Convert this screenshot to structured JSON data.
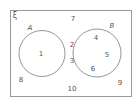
{
  "diagram": {
    "type": "venn",
    "universal_symbol": "ξ",
    "sets": [
      {
        "name": "A",
        "elements_only": [
          "1"
        ]
      },
      {
        "name": "B",
        "elements_only": [
          "4",
          "5",
          "6"
        ]
      }
    ],
    "intersection": [
      "2",
      "3"
    ],
    "outside": [
      "7",
      "8",
      "9",
      "10"
    ],
    "colors": {
      "stroke": "#8a8a8a",
      "frame": "#9a9a9a",
      "text": "#555555",
      "background": "#ffffff"
    }
  },
  "labels": {
    "universal": "ξ",
    "set_a": "A",
    "set_b": "B",
    "n1": "1",
    "n2": "2",
    "n3": "3",
    "n4": "4",
    "n5": "5",
    "n6": "6",
    "n7": "7",
    "n8": "8",
    "n9": "9",
    "n10": "10"
  }
}
